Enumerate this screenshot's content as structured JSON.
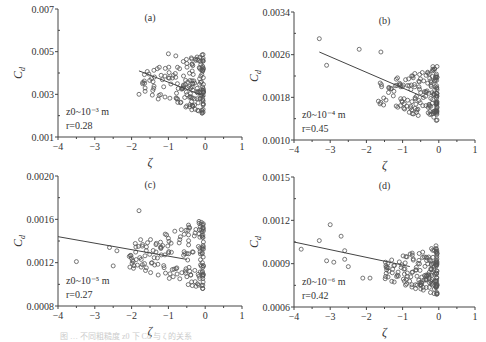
{
  "figure": {
    "caption": "图 … 不同粗糙度 z0 下 Cd 与 ζ 的关系"
  },
  "chart_data": [
    {
      "type": "scatter",
      "panel": "(a)",
      "xlabel": "ζ",
      "ylabel": "Cd",
      "xlim": [
        -4,
        1
      ],
      "ylim": [
        0.001,
        0.007
      ],
      "xticks": [
        -4,
        -3,
        -2,
        -1,
        0,
        1
      ],
      "yticks": [
        "0.001",
        "0.003",
        "0.005",
        "0.007"
      ],
      "annotation": [
        "z0~10^-3 m",
        "r=0.28"
      ],
      "fit_line": {
        "x": [
          -1.8,
          0
        ],
        "y": [
          0.0041,
          0.0029
        ]
      },
      "points": {
        "x_range": [
          -1.8,
          -0.05
        ],
        "y_range": [
          0.0021,
          0.0049
        ],
        "outliers": [
          [
            -1.8,
            0.003
          ],
          [
            -1.7,
            0.0035
          ],
          [
            -1.0,
            0.0049
          ],
          [
            -0.8,
            0.0048
          ]
        ]
      }
    },
    {
      "type": "scatter",
      "panel": "(b)",
      "xlabel": "ζ",
      "ylabel": "Cd",
      "xlim": [
        -4,
        1
      ],
      "ylim": [
        0.001,
        0.0034
      ],
      "xticks": [
        -4,
        -3,
        -2,
        -1,
        0,
        1
      ],
      "yticks": [
        "0.0010",
        "0.0018",
        "0.0026",
        "0.0034"
      ],
      "annotation": [
        "z0~10^-4 m",
        "r=0.45"
      ],
      "fit_line": {
        "x": [
          -3.3,
          -0.4
        ],
        "y": [
          0.00265,
          0.0018
        ]
      },
      "points": {
        "x_range": [
          -1.7,
          -0.05
        ],
        "y_range": [
          0.00135,
          0.0024
        ],
        "outliers": [
          [
            -3.3,
            0.0029
          ],
          [
            -3.1,
            0.0024
          ],
          [
            -2.2,
            0.0027
          ],
          [
            -1.6,
            0.00265
          ]
        ]
      }
    },
    {
      "type": "scatter",
      "panel": "(c)",
      "xlabel": "ζ",
      "ylabel": "Cd",
      "xlim": [
        -4,
        1
      ],
      "ylim": [
        0.0008,
        0.002
      ],
      "xticks": [
        -4,
        -3,
        -2,
        -1,
        0,
        1
      ],
      "yticks": [
        "0.0008",
        "0.0012",
        "0.0016",
        "0.0020"
      ],
      "annotation": [
        "z0~10^-5 m",
        "r=0.27"
      ],
      "fit_line": {
        "x": [
          -4,
          -0.5
        ],
        "y": [
          0.00144,
          0.00123
        ]
      },
      "points": {
        "x_range": [
          -2.1,
          -0.05
        ],
        "y_range": [
          0.00095,
          0.0016
        ],
        "outliers": [
          [
            -3.5,
            0.00121
          ],
          [
            -2.6,
            0.00134
          ],
          [
            -2.4,
            0.00131
          ],
          [
            -2.5,
            0.00117
          ],
          [
            -1.8,
            0.00168
          ]
        ]
      }
    },
    {
      "type": "scatter",
      "panel": "(d)",
      "xlabel": "ζ",
      "ylabel": "Cd",
      "xlim": [
        -4,
        1
      ],
      "ylim": [
        0.0006,
        0.0015
      ],
      "xticks": [
        -4,
        -3,
        -2,
        -1,
        0,
        1
      ],
      "yticks": [
        "0.0006",
        "0.0009",
        "0.0012",
        "0.0015"
      ],
      "annotation": [
        "z0~10^-6 m",
        "r=0.42"
      ],
      "fit_line": {
        "x": [
          -4,
          -0.8
        ],
        "y": [
          0.00105,
          0.00088
        ]
      },
      "points": {
        "x_range": [
          -1.5,
          -0.05
        ],
        "y_range": [
          0.00068,
          0.00103
        ],
        "outliers": [
          [
            -3.8,
            0.001
          ],
          [
            -3.3,
            0.00106
          ],
          [
            -3.0,
            0.00117
          ],
          [
            -2.7,
            0.00109
          ],
          [
            -3.1,
            0.00092
          ],
          [
            -2.9,
            0.00091
          ],
          [
            -2.6,
            0.00099
          ],
          [
            -2.6,
            0.00093
          ],
          [
            -2.5,
            0.00088
          ],
          [
            -2.1,
            0.0008
          ],
          [
            -1.9,
            0.0008
          ]
        ]
      }
    }
  ]
}
